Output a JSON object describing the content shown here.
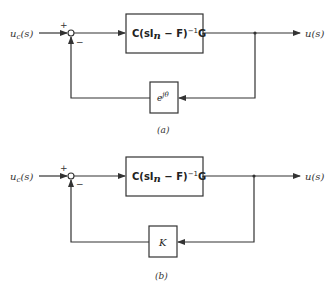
{
  "diagrams": [
    {
      "id": "a",
      "caption": "(a)",
      "input_label": "u_c(s)",
      "input_main": "u",
      "input_sub": "c",
      "input_suffix": "(s)",
      "output_label": "u(s)",
      "plus_sign": "+",
      "minus_sign": "−",
      "forward_block": "C(sI_n − F)^−1 G",
      "forward_block_parts": {
        "pre": "C(sI",
        "sub": "n",
        "mid": " − F)",
        "sup": "−1",
        "post": "G"
      },
      "feedback_block": "e^{jθ}",
      "feedback_base": "e",
      "feedback_sup": "jθ"
    },
    {
      "id": "b",
      "caption": "(b)",
      "input_label": "u_c(s)",
      "input_main": "u",
      "input_sub": "c",
      "input_suffix": "(s)",
      "output_label": "u(s)",
      "plus_sign": "+",
      "minus_sign": "−",
      "forward_block": "C(sI_n − F)^−1 G",
      "forward_block_parts": {
        "pre": "C(sI",
        "sub": "n",
        "mid": " − F)",
        "sup": "−1",
        "post": "G"
      },
      "feedback_block": "K"
    }
  ]
}
